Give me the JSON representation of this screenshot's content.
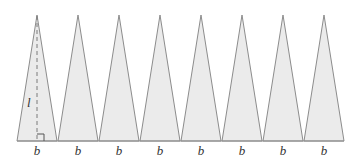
{
  "diagram": {
    "triangle_count": 8,
    "base_label": "b",
    "height_label": "l",
    "base_labels": [
      "b",
      "b",
      "b",
      "b",
      "b",
      "b",
      "b",
      "b"
    ],
    "colors": {
      "fill": "#ebebeb",
      "stroke": "#8c8c8c",
      "dashed": "#7a7a7a"
    }
  }
}
